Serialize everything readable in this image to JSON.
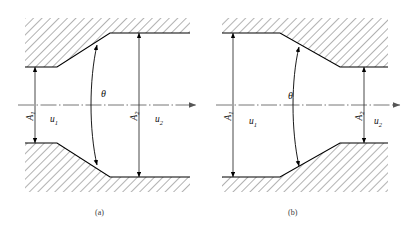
{
  "figure": {
    "title": "",
    "panels": [
      {
        "id": "a",
        "caption": "(a)",
        "kind": "diffuser-expanding-duct",
        "labels": {
          "inlet_area": "A",
          "inlet_area_sub": "1",
          "inlet_velocity": "u",
          "inlet_velocity_sub": "1",
          "outlet_area": "A",
          "outlet_area_sub": "2",
          "outlet_velocity": "u",
          "outlet_velocity_sub": "2",
          "angle": "θ"
        }
      },
      {
        "id": "b",
        "caption": "(b)",
        "kind": "nozzle-contracting-duct",
        "labels": {
          "inlet_area": "A",
          "inlet_area_sub": "1",
          "inlet_velocity": "u",
          "inlet_velocity_sub": "1",
          "outlet_area": "A",
          "outlet_area_sub": "2",
          "outlet_velocity": "u",
          "outlet_velocity_sub": "2",
          "angle": "θ"
        }
      }
    ],
    "colors": {
      "line": "#000000",
      "hatch": "#555555",
      "centerline": "#666666",
      "dimension": "#333333",
      "caption": "#3a3a3a",
      "background": "#ffffff"
    }
  }
}
